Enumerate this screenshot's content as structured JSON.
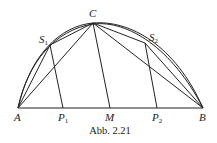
{
  "figure": {
    "caption": "Abb. 2.21",
    "points": {
      "A": {
        "label": "A",
        "sub": ""
      },
      "B": {
        "label": "B",
        "sub": ""
      },
      "C": {
        "label": "C",
        "sub": ""
      },
      "M": {
        "label": "M",
        "sub": ""
      },
      "S1": {
        "label": "S",
        "sub": "1"
      },
      "S2": {
        "label": "S",
        "sub": "2"
      },
      "P1": {
        "label": "P",
        "sub": "1"
      },
      "P2": {
        "label": "P",
        "sub": "2"
      }
    }
  }
}
